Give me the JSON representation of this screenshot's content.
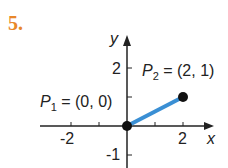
{
  "problem_number": "5.",
  "figure": {
    "x_axis_label": "x",
    "y_axis_label": "y",
    "x_ticks": [
      "-2",
      "2"
    ],
    "y_ticks": [
      "2",
      "-1"
    ],
    "p1": {
      "name": "P",
      "sub": "1",
      "coords": "= (0, 0)"
    },
    "p2": {
      "name": "P",
      "sub": "2",
      "coords": "= (2, 1)"
    },
    "segment_color": "#3a8fd4",
    "accent_color": "#e8872a"
  }
}
